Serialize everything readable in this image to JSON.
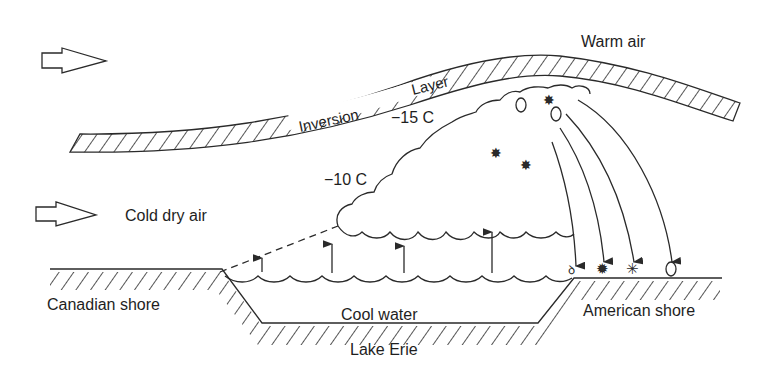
{
  "diagram": {
    "type": "lake-effect snow cross-section",
    "labels": {
      "warm_air": "Warm air",
      "inversion": "Inversion",
      "layer": "Layer",
      "temp_high": "−15 C",
      "temp_low": "−10 C",
      "cold_dry_air": "Cold dry air",
      "canadian_shore": "Canadian shore",
      "cool_water": "Cool water",
      "american_shore": "American shore",
      "lake": "Lake Erie"
    },
    "icons": [
      "wind-arrow-icon",
      "wind-arrow-icon",
      "updraft-arrow-icon",
      "snowflake-icon",
      "ice-crystal-icon",
      "graupel-icon",
      "hail-icon"
    ],
    "colors": {
      "line": "#2a2a2a",
      "background": "#ffffff"
    }
  }
}
